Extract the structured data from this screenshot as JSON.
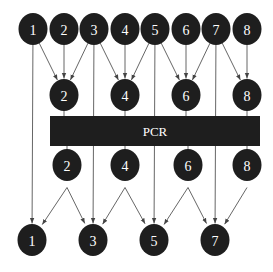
{
  "diagram": {
    "colors": {
      "node_fill": "#1e1e1e",
      "edge": "#555555",
      "text": "#ffffff",
      "background": "#ffffff"
    },
    "pcr_box": {
      "label": "PCR",
      "x": 50,
      "y": 116,
      "width": 210,
      "height": 30
    },
    "rows": {
      "top": [
        {
          "label": "1",
          "x": 33,
          "y": 29
        },
        {
          "label": "2",
          "x": 64,
          "y": 29
        },
        {
          "label": "3",
          "x": 94,
          "y": 29
        },
        {
          "label": "4",
          "x": 125,
          "y": 29
        },
        {
          "label": "5",
          "x": 155,
          "y": 29
        },
        {
          "label": "6",
          "x": 186,
          "y": 29
        },
        {
          "label": "7",
          "x": 216,
          "y": 29
        },
        {
          "label": "8",
          "x": 247,
          "y": 29
        }
      ],
      "pre_pcr": [
        {
          "label": "2",
          "x": 64,
          "y": 95
        },
        {
          "label": "4",
          "x": 125,
          "y": 95
        },
        {
          "label": "6",
          "x": 186,
          "y": 95
        },
        {
          "label": "8",
          "x": 247,
          "y": 95
        }
      ],
      "post_pcr": [
        {
          "label": "2",
          "x": 67,
          "y": 165
        },
        {
          "label": "4",
          "x": 125,
          "y": 165
        },
        {
          "label": "6",
          "x": 188,
          "y": 165
        },
        {
          "label": "8",
          "x": 247,
          "y": 165
        }
      ],
      "bottom": [
        {
          "label": "1",
          "x": 32,
          "y": 240
        },
        {
          "label": "3",
          "x": 93,
          "y": 240
        },
        {
          "label": "5",
          "x": 154,
          "y": 240
        },
        {
          "label": "7",
          "x": 215,
          "y": 240
        }
      ]
    },
    "edges": [
      {
        "from": "top-1",
        "to": "pre-2"
      },
      {
        "from": "top-2",
        "to": "pre-2"
      },
      {
        "from": "top-3",
        "to": "pre-2"
      },
      {
        "from": "top-3",
        "to": "pre-4"
      },
      {
        "from": "top-4",
        "to": "pre-4"
      },
      {
        "from": "top-5",
        "to": "pre-4"
      },
      {
        "from": "top-5",
        "to": "pre-6"
      },
      {
        "from": "top-6",
        "to": "pre-6"
      },
      {
        "from": "top-7",
        "to": "pre-6"
      },
      {
        "from": "top-7",
        "to": "pre-8"
      },
      {
        "from": "top-8",
        "to": "pre-8"
      },
      {
        "from": "top-1",
        "to": "bottom-1"
      },
      {
        "from": "top-3",
        "to": "bottom-3"
      },
      {
        "from": "top-5",
        "to": "bottom-5"
      },
      {
        "from": "top-7",
        "to": "bottom-7"
      },
      {
        "from": "post-2",
        "to": "bottom-1"
      },
      {
        "from": "post-2",
        "to": "bottom-3"
      },
      {
        "from": "post-4",
        "to": "bottom-3"
      },
      {
        "from": "post-4",
        "to": "bottom-5"
      },
      {
        "from": "post-6",
        "to": "bottom-5"
      },
      {
        "from": "post-6",
        "to": "bottom-7"
      },
      {
        "from": "post-8",
        "to": "bottom-7"
      }
    ]
  }
}
